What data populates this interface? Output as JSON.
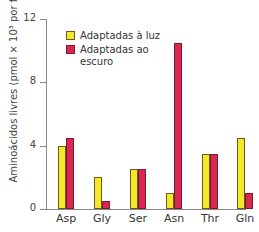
{
  "chart_data": {
    "type": "bar",
    "title": "",
    "xlabel": "",
    "ylabel": "Aminoácidos livres (pmol × 10³ por folha)",
    "ylim": [
      0,
      12
    ],
    "yticks": [
      0,
      4,
      8,
      12
    ],
    "grid": false,
    "legend_position": "top-left inside",
    "categories": [
      "Asp",
      "Gly",
      "Ser",
      "Asn",
      "Thr",
      "Gln"
    ],
    "series": [
      {
        "name": "Adaptadas à luz",
        "color": "#f5e82a",
        "values": [
          4,
          2,
          2.5,
          1,
          3.5,
          4.5
        ]
      },
      {
        "name": "Adaptadas ao escuro",
        "color": "#d8284f",
        "values": [
          4.5,
          0.5,
          2.5,
          10.5,
          3.5,
          1
        ]
      }
    ]
  },
  "axis": {
    "ylabel": "Aminoácidos livres (pmol × 10³ por folha)",
    "ticks": [
      "0",
      "4",
      "8",
      "12"
    ]
  },
  "legend": {
    "items": [
      "Adaptadas à luz",
      "Adaptadas ao escuro"
    ]
  }
}
